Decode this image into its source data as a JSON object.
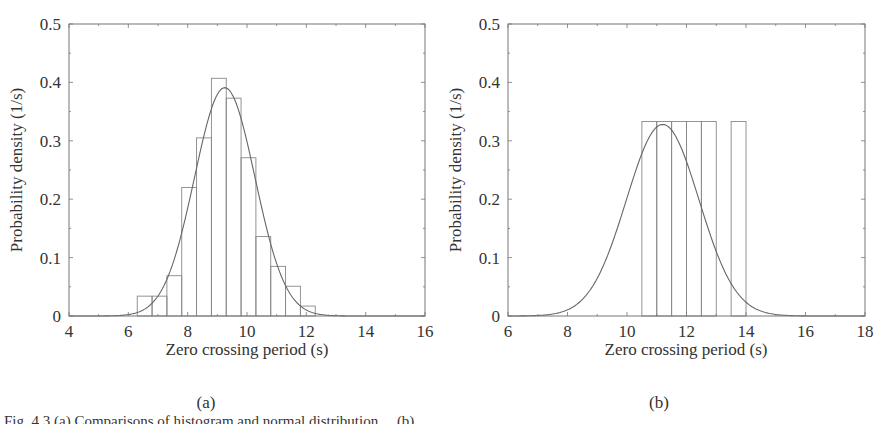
{
  "figure": {
    "panels": [
      {
        "id": "a",
        "panel_label": "(a)",
        "xlabel": "Zero crossing period (s)",
        "ylabel": "Probability density (1/s)"
      },
      {
        "id": "b",
        "panel_label": "(b)",
        "xlabel": "Zero crossing period (s)",
        "ylabel": "Probability density (1/s)"
      }
    ],
    "caption": "Fig. 4.3 (a) Comparisons of histogram and normal distribution ... (b) ..."
  },
  "colors": {
    "axis": "#777777",
    "bar_edge": "#888888",
    "curve": "#666666",
    "text": "#333333"
  },
  "chart_data": [
    {
      "type": "bar",
      "subtype": "histogram_with_fitted_pdf",
      "title": "",
      "panel": "(a)",
      "xlabel": "Zero crossing period (s)",
      "ylabel": "Probability density (1/s)",
      "xlim": [
        4,
        16
      ],
      "ylim": [
        0,
        0.5
      ],
      "xticks": [
        4,
        6,
        8,
        10,
        12,
        14,
        16
      ],
      "yticks": [
        0,
        0.1,
        0.2,
        0.3,
        0.4,
        0.5
      ],
      "ytick_labels": [
        "0",
        "0.1",
        "0.2",
        "0.3",
        "0.4",
        "0.5"
      ],
      "grid": false,
      "bin_width": 0.5,
      "bin_edges": [
        6.3,
        6.8,
        7.3,
        7.8,
        8.3,
        8.8,
        9.3,
        9.8,
        10.3,
        10.8,
        11.3,
        11.8,
        12.3
      ],
      "values": [
        0.034,
        0.034,
        0.069,
        0.22,
        0.305,
        0.407,
        0.373,
        0.271,
        0.136,
        0.085,
        0.051,
        0.017
      ],
      "series": [
        {
          "name": "Histogram",
          "kind": "histogram"
        },
        {
          "name": "Normal PDF fit",
          "kind": "line",
          "mean": 9.25,
          "std": 1.02,
          "peak": 0.391
        }
      ]
    },
    {
      "type": "bar",
      "subtype": "histogram_with_fitted_pdf",
      "title": "",
      "panel": "(b)",
      "xlabel": "Zero crossing period (s)",
      "ylabel": "Probability density (1/s)",
      "xlim": [
        6,
        18
      ],
      "ylim": [
        0,
        0.5
      ],
      "xticks": [
        6,
        8,
        10,
        12,
        14,
        16,
        18
      ],
      "yticks": [
        0,
        0.1,
        0.2,
        0.3,
        0.4,
        0.5
      ],
      "ytick_labels": [
        "0",
        "0.1",
        "0.2",
        "0.3",
        "0.4",
        "0.5"
      ],
      "grid": false,
      "bin_width": 0.5,
      "bin_edges": [
        10.5,
        11.0,
        11.5,
        12.0,
        12.5,
        13.0,
        13.5,
        14.0
      ],
      "values": [
        0.333,
        0.333,
        0.333,
        0.333,
        0.333,
        0,
        0.333
      ],
      "series": [
        {
          "name": "Histogram",
          "kind": "histogram"
        },
        {
          "name": "Normal PDF fit",
          "kind": "line",
          "mean": 11.2,
          "std": 1.22,
          "peak": 0.328
        }
      ]
    }
  ]
}
